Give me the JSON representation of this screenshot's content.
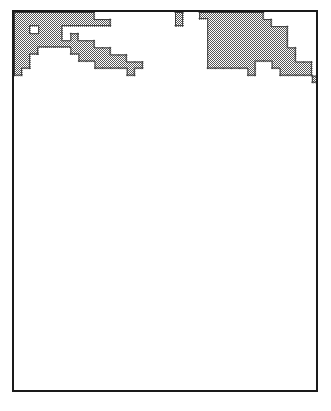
{
  "figure": {
    "type": "raster-cell-map",
    "frame": {
      "x": 12,
      "y": 10,
      "width": 306,
      "height": 382,
      "border_width": 2,
      "border_color": "#1a1a1a",
      "background_color": "#ffffff"
    },
    "grid": {
      "columns": 38,
      "rows": 54,
      "cell_width": 8.05,
      "cell_height": 7.07,
      "gridlines_visible": false
    },
    "cell_style": {
      "fill_color": "#b8b8b8",
      "fill_pattern": "50-percent-checkerboard-dither",
      "outline_color": "#3a3a3a",
      "outline_width": 1
    },
    "legend": {
      "visible": false,
      "entries": []
    },
    "axes": {
      "visible": false,
      "x_ticks": [],
      "y_ticks": [],
      "xlabel": "",
      "ylabel": ""
    },
    "title": ""
  },
  "chart_data": {
    "type": "heatmap",
    "title": "",
    "subtitle": "",
    "xlabel": "",
    "ylabel": "",
    "grid": false,
    "legend_position": "none",
    "columns": 38,
    "rows": 54,
    "value_legend": {
      "0": "unshaded / background",
      "1": "shaded cell"
    },
    "xlim": [
      0,
      38
    ],
    "ylim": [
      0,
      54
    ],
    "cells": [
      [
        0,
        0,
        3,
        1
      ],
      [
        0,
        1,
        5,
        1
      ],
      [
        0,
        2,
        5,
        1
      ],
      [
        0,
        3,
        4,
        1
      ],
      [
        0,
        4,
        3,
        1
      ],
      [
        0,
        5,
        3,
        1
      ],
      [
        0,
        6,
        3,
        1
      ],
      [
        1,
        0,
        3,
        1
      ],
      [
        1,
        1,
        4,
        1
      ],
      [
        1,
        2,
        4,
        1
      ],
      [
        1,
        3,
        4,
        1
      ],
      [
        1,
        4,
        3,
        1
      ],
      [
        1,
        5,
        3,
        1
      ],
      [
        2,
        0,
        3,
        1
      ],
      [
        2,
        1,
        3,
        1
      ],
      [
        2,
        2,
        3,
        1
      ],
      [
        2,
        3,
        3,
        1
      ],
      [
        3,
        0,
        4,
        1
      ],
      [
        3,
        1,
        3,
        1
      ],
      [
        3,
        2,
        3,
        1
      ],
      [
        4,
        0,
        4,
        1
      ],
      [
        4,
        1,
        3,
        1
      ],
      [
        4,
        2,
        3,
        1
      ],
      [
        5,
        0,
        2,
        1
      ],
      [
        5,
        2,
        3,
        1
      ],
      [
        6,
        0,
        2,
        1
      ],
      [
        6,
        3,
        3,
        1
      ],
      [
        7,
        0,
        2,
        1
      ],
      [
        7,
        3,
        3,
        1
      ],
      [
        8,
        0,
        2,
        1
      ],
      [
        8,
        4,
        3,
        1
      ],
      [
        9,
        0,
        2,
        1
      ],
      [
        9,
        4,
        3,
        1
      ],
      [
        10,
        1,
        1,
        1
      ],
      [
        10,
        5,
        3,
        1
      ],
      [
        11,
        1,
        1,
        1
      ],
      [
        11,
        5,
        3,
        1
      ],
      [
        12,
        6,
        2,
        1
      ],
      [
        13,
        6,
        2,
        1
      ],
      [
        14,
        7,
        1,
        1
      ],
      [
        14,
        8,
        1,
        1
      ],
      [
        15,
        7,
        1,
        1
      ],
      [
        20,
        0,
        1,
        1
      ],
      [
        20,
        1,
        1,
        1
      ],
      [
        23,
        0,
        1,
        1
      ],
      [
        24,
        0,
        7,
        1
      ],
      [
        24,
        7,
        1,
        1
      ],
      [
        25,
        0,
        8,
        1
      ],
      [
        26,
        0,
        8,
        1
      ],
      [
        27,
        0,
        8,
        1
      ],
      [
        28,
        0,
        8,
        1
      ],
      [
        29,
        0,
        9,
        1
      ],
      [
        30,
        0,
        7,
        1
      ],
      [
        31,
        1,
        6,
        1
      ],
      [
        32,
        2,
        6,
        1
      ],
      [
        33,
        3,
        6,
        1
      ],
      [
        33,
        2,
        1,
        1
      ],
      [
        34,
        5,
        4,
        1
      ],
      [
        35,
        7,
        2,
        1
      ],
      [
        36,
        7,
        2,
        1
      ],
      [
        37,
        9,
        1,
        1
      ]
    ],
    "clusters": [
      {
        "id": "top-left-diagonal",
        "label": "",
        "approx_cell_count": 46,
        "centroid": [
          5,
          4
        ]
      },
      {
        "id": "top-right-block",
        "label": "",
        "approx_cell_count": 78,
        "centroid": [
          28,
          5
        ]
      },
      {
        "id": "mid-right-band",
        "label": "",
        "approx_cell_count": 92,
        "centroid": [
          27,
          15
        ]
      },
      {
        "id": "mid-left-hook",
        "label": "",
        "approx_cell_count": 7,
        "centroid": [
          6,
          20
        ]
      },
      {
        "id": "mid-left-blob",
        "label": "",
        "approx_cell_count": 14,
        "centroid": [
          7,
          27
        ]
      },
      {
        "id": "mid-left-step",
        "label": "",
        "approx_cell_count": 4,
        "centroid": [
          11,
          28
        ]
      },
      {
        "id": "isolated-top-a",
        "label": "",
        "approx_cell_count": 1,
        "centroid": [
          20,
          0
        ]
      },
      {
        "id": "isolated-top-b",
        "label": "",
        "approx_cell_count": 1,
        "centroid": [
          20,
          2
        ]
      },
      {
        "id": "isolated-top-c",
        "label": "",
        "approx_cell_count": 1,
        "centroid": [
          23,
          1
        ]
      },
      {
        "id": "isolated-right-a",
        "label": "",
        "approx_cell_count": 1,
        "centroid": [
          33,
          2
        ]
      },
      {
        "id": "isolated-right-b",
        "label": "",
        "approx_cell_count": 1,
        "centroid": [
          33,
          9
        ]
      },
      {
        "id": "isolated-mid-left",
        "label": "",
        "approx_cell_count": 1,
        "centroid": [
          19,
          16
        ]
      },
      {
        "id": "isolated-far-right",
        "label": "",
        "approx_cell_count": 1,
        "centroid": [
          32,
          24
        ]
      },
      {
        "id": "isolated-lower-a",
        "label": "",
        "approx_cell_count": 1,
        "centroid": [
          23,
          28
        ]
      },
      {
        "id": "isolated-lower-b",
        "label": "",
        "approx_cell_count": 1,
        "centroid": [
          25,
          28
        ]
      },
      {
        "id": "isolated-bottom-left",
        "label": "",
        "approx_cell_count": 2,
        "centroid": [
          1,
          32
        ]
      }
    ],
    "holes": [
      {
        "id": "hole-top-left-1",
        "centroid": [
          2,
          2
        ]
      },
      {
        "id": "hole-top-left-2",
        "centroid": [
          6,
          3
        ]
      },
      {
        "id": "hole-top-left-3",
        "centroid": [
          6,
          5
        ]
      },
      {
        "id": "hole-mid-right-1",
        "centroid": [
          26,
          13
        ]
      },
      {
        "id": "hole-mid-right-2",
        "centroid": [
          28,
          16
        ]
      },
      {
        "id": "hole-mid-right-3",
        "centroid": [
          31,
          11
        ]
      },
      {
        "id": "hole-mid-right-4",
        "centroid": [
          30,
          11
        ]
      }
    ]
  }
}
